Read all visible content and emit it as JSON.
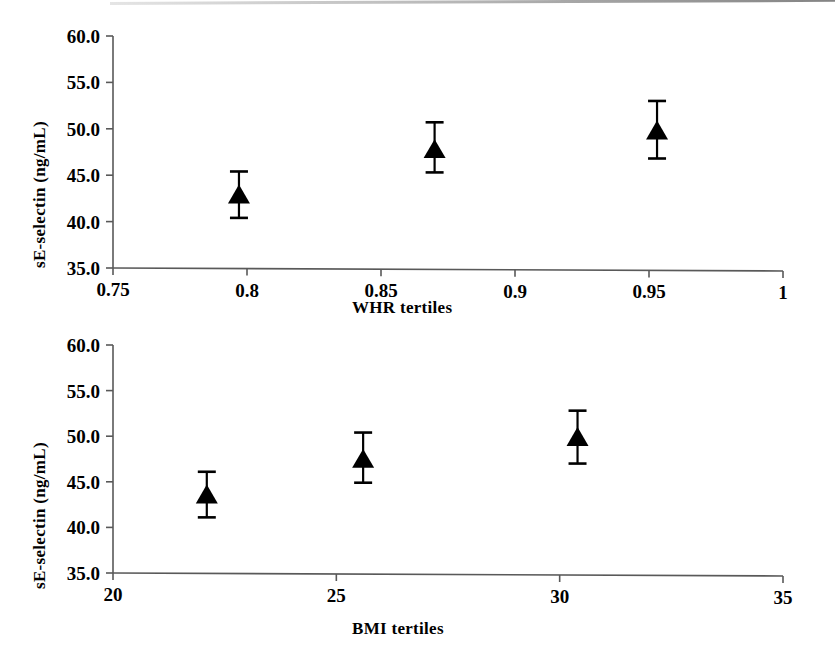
{
  "figure": {
    "background_color": "#ffffff",
    "ink_color": "#000000",
    "axis_color": "#595959"
  },
  "panels": [
    {
      "id": "whr",
      "y_axis_title": "sE-selectin (ng/mL)",
      "x_axis_title": "WHR tertiles",
      "y_ticks": [
        "60.0",
        "55.0",
        "50.0",
        "45.0",
        "40.0",
        "35.0"
      ],
      "x_ticks": [
        "0.75",
        "0.8",
        "0.85",
        "0.9",
        "0.95",
        "1"
      ]
    },
    {
      "id": "bmi",
      "y_axis_title": "sE-selectin (ng/mL)",
      "x_axis_title": "BMI tertiles",
      "y_ticks": [
        "60.0",
        "55.0",
        "50.0",
        "45.0",
        "40.0",
        "35.0"
      ],
      "x_ticks": [
        "20",
        "25",
        "30",
        "35"
      ]
    }
  ],
  "chart_data": [
    {
      "type": "scatter",
      "title": "",
      "xlabel": "WHR tertiles",
      "ylabel": "sE-selectin (ng/mL)",
      "xlim": [
        0.75,
        1.0
      ],
      "ylim": [
        35.0,
        60.0
      ],
      "xticks": [
        0.75,
        0.8,
        0.85,
        0.9,
        0.95,
        1.0
      ],
      "yticks": [
        35.0,
        40.0,
        45.0,
        50.0,
        55.0,
        60.0
      ],
      "grid": false,
      "legend": "none",
      "marker": "filled-triangle",
      "errorbars": true,
      "x": [
        0.797,
        0.87,
        0.953
      ],
      "y": [
        42.8,
        47.7,
        49.7
      ],
      "yerr_low": [
        40.4,
        45.3,
        46.8
      ],
      "yerr_high": [
        45.4,
        50.7,
        53.0
      ]
    },
    {
      "type": "scatter",
      "title": "",
      "xlabel": "BMI tertiles",
      "ylabel": "sE-selectin (ng/mL)",
      "xlim": [
        20.0,
        35.0
      ],
      "ylim": [
        35.0,
        60.0
      ],
      "xticks": [
        20,
        25,
        30,
        35
      ],
      "yticks": [
        35.0,
        40.0,
        45.0,
        50.0,
        55.0,
        60.0
      ],
      "grid": false,
      "legend": "none",
      "marker": "filled-triangle",
      "errorbars": true,
      "x": [
        22.1,
        25.6,
        30.4
      ],
      "y": [
        43.5,
        47.4,
        49.8
      ],
      "yerr_low": [
        41.1,
        44.9,
        47.0
      ],
      "yerr_high": [
        46.1,
        50.4,
        52.8
      ]
    }
  ]
}
